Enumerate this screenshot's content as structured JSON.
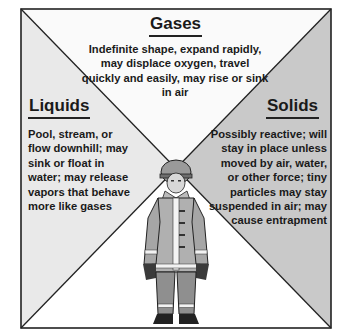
{
  "diagram": {
    "colors": {
      "border": "#222222",
      "gases_fill": "#fafafa",
      "liquids_fill": "#e9e9e9",
      "solids_fill": "#c9c9c9",
      "bottom_fill": "#ffffff"
    },
    "gases": {
      "heading": "Gases",
      "text": "Indefinite shape, expand rapidly, may displace oxygen, travel quickly and easily, may rise or sink in air"
    },
    "liquids": {
      "heading": "Liquids",
      "text": "Pool, stream, or flow downhill; may sink or float in water; may release vapors that behave more like gases"
    },
    "solids": {
      "heading": "Solids",
      "text": "Possibly reactive; will stay in place unless moved by air, water, or other force; tiny particles may stay suspended in air; may cause entrapment"
    },
    "figure": {
      "icon": "firefighter-in-turnout-gear-icon"
    }
  }
}
